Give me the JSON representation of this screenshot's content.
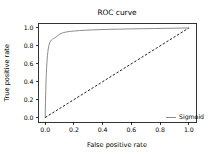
{
  "chart_data": {
    "type": "line",
    "title": "ROC curve",
    "xlabel": "False positive rate",
    "ylabel": "True positive rate",
    "xlim": [
      -0.05,
      1.05
    ],
    "ylim": [
      -0.05,
      1.05
    ],
    "grid": false,
    "legend_position": "lower right",
    "xticks": [
      "0.0",
      "0.2",
      "0.4",
      "0.6",
      "0.8",
      "1.0"
    ],
    "xtick_values": [
      0.0,
      0.2,
      0.4,
      0.6,
      0.8,
      1.0
    ],
    "yticks": [
      "0.0",
      "0.2",
      "0.4",
      "0.6",
      "0.8",
      "1.0"
    ],
    "ytick_values": [
      0.0,
      0.2,
      0.4,
      0.6,
      0.8,
      1.0
    ],
    "series": [
      {
        "name": "Sigmoid",
        "style": "solid",
        "color": "#7f7f7f",
        "x": [
          0.0,
          0.002,
          0.004,
          0.006,
          0.008,
          0.01,
          0.012,
          0.014,
          0.016,
          0.018,
          0.02,
          0.024,
          0.028,
          0.032,
          0.038,
          0.044,
          0.05,
          0.058,
          0.066,
          0.076,
          0.088,
          0.1,
          0.115,
          0.13,
          0.15,
          0.175,
          0.2,
          0.24,
          0.28,
          0.33,
          0.39,
          0.45,
          0.52,
          0.6,
          0.68,
          0.76,
          0.84,
          0.9,
          0.95,
          1.0
        ],
        "y": [
          0.0,
          0.16,
          0.3,
          0.41,
          0.49,
          0.56,
          0.61,
          0.655,
          0.695,
          0.725,
          0.752,
          0.79,
          0.818,
          0.838,
          0.855,
          0.866,
          0.874,
          0.882,
          0.889,
          0.9,
          0.916,
          0.93,
          0.941,
          0.949,
          0.956,
          0.962,
          0.966,
          0.971,
          0.975,
          0.979,
          0.982,
          0.985,
          0.987,
          0.99,
          0.992,
          0.994,
          0.996,
          0.997,
          0.999,
          1.0
        ]
      },
      {
        "name": "chance",
        "style": "dashed",
        "color": "#000000",
        "x": [
          0.0,
          1.0
        ],
        "y": [
          0.0,
          1.0
        ]
      }
    ],
    "legend_entries": [
      "Sigmoid"
    ]
  },
  "legend": {
    "sigmoid_label": "Sigmoid"
  }
}
